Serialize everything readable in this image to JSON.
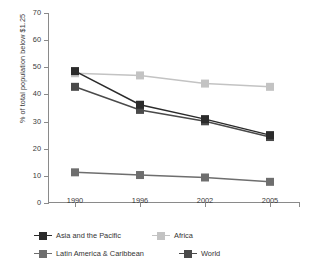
{
  "chart_data": {
    "type": "line",
    "title": "",
    "xlabel": "",
    "ylabel": "% of total population below $1.25",
    "categories": [
      "1990",
      "1996",
      "2002",
      "2005"
    ],
    "x": [
      1990,
      1996,
      2002,
      2005
    ],
    "ylim": [
      0,
      70
    ],
    "yticks": [
      0,
      10,
      20,
      30,
      40,
      50,
      60,
      70
    ],
    "ytick_labels": [
      "0",
      "10",
      "20",
      "30",
      "40",
      "50",
      "60",
      "70"
    ],
    "grid": false,
    "legend_position": "bottom",
    "series": [
      {
        "name": "Asia and the Pacific",
        "color": "#2b2b2b",
        "values": [
          48.6,
          36.2,
          30.9,
          25.0
        ]
      },
      {
        "name": "Africa",
        "color": "#c3c3c3",
        "values": [
          47.8,
          47.0,
          44.0,
          42.8
        ]
      },
      {
        "name": "Latin America & Caribbean",
        "color": "#6e6e6e",
        "values": [
          11.3,
          10.3,
          9.4,
          7.8
        ]
      },
      {
        "name": "World",
        "color": "#4a4a4a",
        "values": [
          42.8,
          34.3,
          30.1,
          24.3
        ]
      }
    ]
  },
  "legend": {
    "rows": [
      [
        {
          "label": "Asia and the Pacific",
          "color": "#2b2b2b"
        },
        {
          "label": "Africa",
          "color": "#c3c3c3"
        }
      ],
      [
        {
          "label": "Latin America & Caribbean",
          "color": "#6e6e6e"
        },
        {
          "label": "World",
          "color": "#4a4a4a"
        }
      ]
    ]
  },
  "axis": {
    "line_color": "#8a8a8a",
    "text_color": "#3a3a3a"
  }
}
